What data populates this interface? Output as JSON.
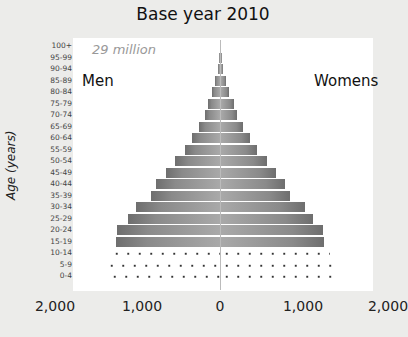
{
  "title": "Base year 2010",
  "total_label": "29 million",
  "men_label": "Men",
  "women_label": "Womens",
  "y_axis_title": "Age (years)",
  "x_ticks": [
    "2,000",
    "1,000",
    "0",
    "1,000",
    "2,000"
  ],
  "chart_data": {
    "type": "bar",
    "subtype": "population-pyramid",
    "title": "Base year 2010",
    "annotation": "29 million",
    "xlabel": "",
    "ylabel": "Age (years)",
    "xlim": [
      -2000,
      2000
    ],
    "x_tick_labels": [
      "2,000",
      "1,000",
      "0",
      "1,000",
      "2,000"
    ],
    "categories": [
      "100+",
      "95-99",
      "90-94",
      "85-89",
      "80-84",
      "75-79",
      "70-74",
      "65-69",
      "60-64",
      "55-59",
      "50-54",
      "45-49",
      "40-44",
      "35-39",
      "30-34",
      "25-29",
      "20-24",
      "15-19",
      "10-14",
      "5-9",
      "0-4"
    ],
    "series": [
      {
        "name": "Men",
        "values": [
          5,
          10,
          25,
          60,
          90,
          140,
          180,
          250,
          330,
          420,
          540,
          640,
          760,
          820,
          1000,
          1100,
          1230,
          1240,
          1300,
          1360,
          1320
        ]
      },
      {
        "name": "Womens",
        "values": [
          5,
          12,
          28,
          65,
          100,
          150,
          190,
          260,
          340,
          430,
          550,
          650,
          760,
          820,
          1000,
          1100,
          1220,
          1230,
          1300,
          1350,
          1340
        ]
      }
    ],
    "legend": {
      "left": "Men",
      "right": "Womens"
    }
  }
}
